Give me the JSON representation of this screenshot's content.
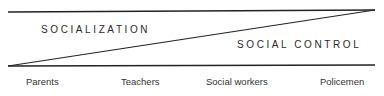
{
  "diagram": {
    "regions": {
      "upper": "SOCIALIZATION",
      "lower": "SOCIAL CONTROL"
    },
    "continuum_labels": [
      "Parents",
      "Teachers",
      "Social workers",
      "Policemen"
    ]
  }
}
